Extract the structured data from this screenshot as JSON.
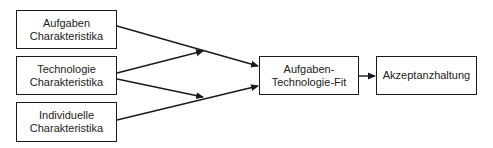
{
  "diagram": {
    "nodes": [
      {
        "id": "task",
        "line1": "Aufgaben",
        "line2": "Charakteristika"
      },
      {
        "id": "tech",
        "line1": "Technologie",
        "line2": "Charakteristika"
      },
      {
        "id": "indiv",
        "line1": "Individuelle",
        "line2": "Charakteristika"
      },
      {
        "id": "ttf",
        "line1": "Aufgaben-",
        "line2": "Technologie-Fit"
      },
      {
        "id": "accept",
        "line1": "Akzeptanzhaltung"
      }
    ],
    "edges": [
      {
        "from": "task",
        "to": "ttf"
      },
      {
        "from": "tech",
        "to": "task-ttf-edge"
      },
      {
        "from": "tech",
        "to": "indiv-ttf-edge"
      },
      {
        "from": "indiv",
        "to": "ttf"
      },
      {
        "from": "ttf",
        "to": "accept"
      }
    ],
    "colors": {
      "stroke": "#1a1a1a",
      "fill": "#ffffff",
      "text": "#222222"
    }
  }
}
